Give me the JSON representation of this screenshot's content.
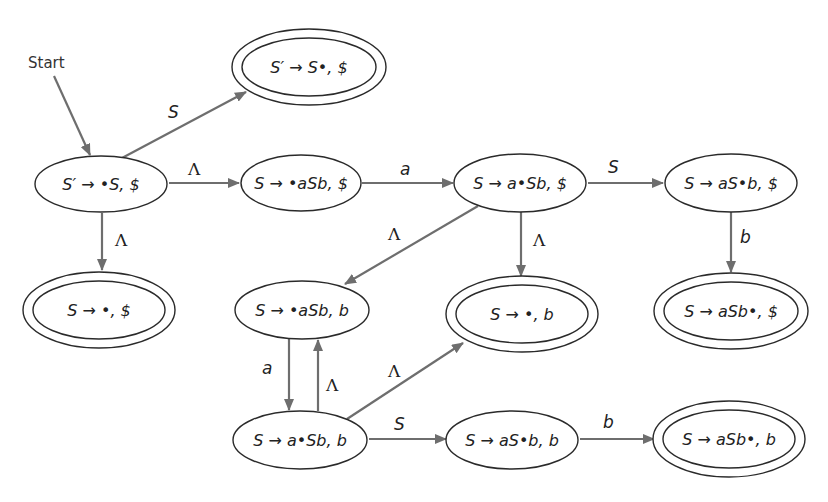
{
  "diagram": {
    "start_label": "Start",
    "colors": {
      "edge": "#6e6e6e",
      "node_stroke": "#2a2a2a",
      "text": "#222222"
    },
    "nodes": [
      {
        "id": "n1",
        "label": "S′ → •S, $",
        "accepting": false
      },
      {
        "id": "n2",
        "label": "S′ → S•, $",
        "accepting": true
      },
      {
        "id": "n3",
        "label": "S → •aSb, $",
        "accepting": false
      },
      {
        "id": "n4",
        "label": "S → a•Sb, $",
        "accepting": false
      },
      {
        "id": "n5",
        "label": "S → aS•b, $",
        "accepting": false
      },
      {
        "id": "n6",
        "label": "S → •, $",
        "accepting": true
      },
      {
        "id": "n7",
        "label": "S → •aSb, b",
        "accepting": false
      },
      {
        "id": "n8",
        "label": "S → •, b",
        "accepting": true
      },
      {
        "id": "n9",
        "label": "S → aSb•, $",
        "accepting": true
      },
      {
        "id": "n10",
        "label": "S → a•Sb, b",
        "accepting": false
      },
      {
        "id": "n11",
        "label": "S → aS•b, b",
        "accepting": false
      },
      {
        "id": "n12",
        "label": "S → aSb•, b",
        "accepting": true
      }
    ],
    "edges": [
      {
        "from": "n1",
        "to": "n2",
        "label": "S"
      },
      {
        "from": "n1",
        "to": "n3",
        "label": "Λ"
      },
      {
        "from": "n1",
        "to": "n6",
        "label": "Λ"
      },
      {
        "from": "n3",
        "to": "n4",
        "label": "a"
      },
      {
        "from": "n4",
        "to": "n5",
        "label": "S"
      },
      {
        "from": "n4",
        "to": "n7",
        "label": "Λ"
      },
      {
        "from": "n4",
        "to": "n8",
        "label": "Λ"
      },
      {
        "from": "n5",
        "to": "n9",
        "label": "b"
      },
      {
        "from": "n7",
        "to": "n10",
        "label": "a"
      },
      {
        "from": "n10",
        "to": "n7",
        "label": "Λ"
      },
      {
        "from": "n10",
        "to": "n8",
        "label": "Λ"
      },
      {
        "from": "n10",
        "to": "n11",
        "label": "S"
      },
      {
        "from": "n11",
        "to": "n12",
        "label": "b"
      }
    ]
  }
}
